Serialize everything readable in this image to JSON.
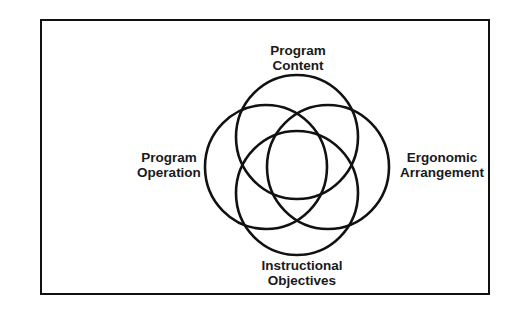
{
  "diagram": {
    "type": "four-circle overlapping venn",
    "labels": {
      "top": [
        "Program",
        "Content"
      ],
      "left": [
        "Program",
        "Operation"
      ],
      "right": [
        "Ergonomic",
        "Arrangement"
      ],
      "bottom": [
        "Instructional",
        "Objectives"
      ]
    },
    "stroke_color": "#111111"
  }
}
